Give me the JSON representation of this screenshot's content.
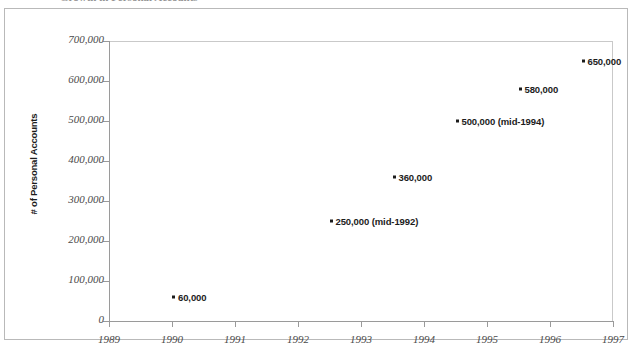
{
  "figure": {
    "title_clipped": "Growth in Personal Accounts"
  },
  "chart_data": {
    "type": "scatter",
    "title": "Growth in Personal Accounts",
    "xlabel": "",
    "ylabel": "# of Personal Accounts",
    "xlim": [
      1989,
      1997
    ],
    "ylim": [
      0,
      700000
    ],
    "grid": false,
    "legend": null,
    "x_ticks": [
      "1989",
      "1990",
      "1991",
      "1992",
      "1993",
      "1994",
      "1995",
      "1996",
      "1997"
    ],
    "y_ticks": [
      "0",
      "100,000",
      "200,000",
      "300,000",
      "400,000",
      "500,000",
      "600,000",
      "700,000"
    ],
    "points": [
      {
        "x": 1990.0,
        "y": 60000,
        "label": "60,000"
      },
      {
        "x": 1992.5,
        "y": 250000,
        "label": "250,000 (mid-1992)"
      },
      {
        "x": 1993.5,
        "y": 360000,
        "label": "360,000"
      },
      {
        "x": 1994.5,
        "y": 500000,
        "label": "500,000 (mid-1994)"
      },
      {
        "x": 1995.5,
        "y": 580000,
        "label": "580,000"
      },
      {
        "x": 1996.5,
        "y": 650000,
        "label": "650,000"
      }
    ]
  },
  "colors": {
    "marker": "#1c1c1c",
    "axis": "#9a9a9a",
    "frame": "#b9b9b9",
    "tick_text": "#4a4a4a",
    "background": "#ffffff"
  }
}
